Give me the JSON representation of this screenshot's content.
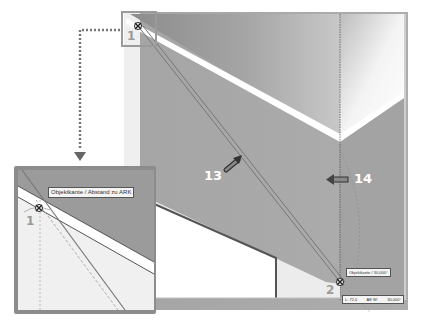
{
  "callouts": {
    "c13": "13",
    "c14": "14"
  },
  "points": {
    "p1_main": "1",
    "p2_main": "2",
    "p1_inset": "1"
  },
  "inset": {
    "tooltip": "Objektkante /  Abstand zu ARK"
  },
  "status": {
    "snap_label": "Objektkante / 30,000°",
    "length": "L: 72,0",
    "angle_label": "AE W:",
    "angle_value": "30,000°"
  },
  "colors": {
    "plane_dark": "#9a9a9a",
    "plane_mid": "#a8a8a8",
    "plane_light": "#eeeeee",
    "edge_white": "#ffffff",
    "arrow": "#555555",
    "dotted_connector": "#777777"
  }
}
